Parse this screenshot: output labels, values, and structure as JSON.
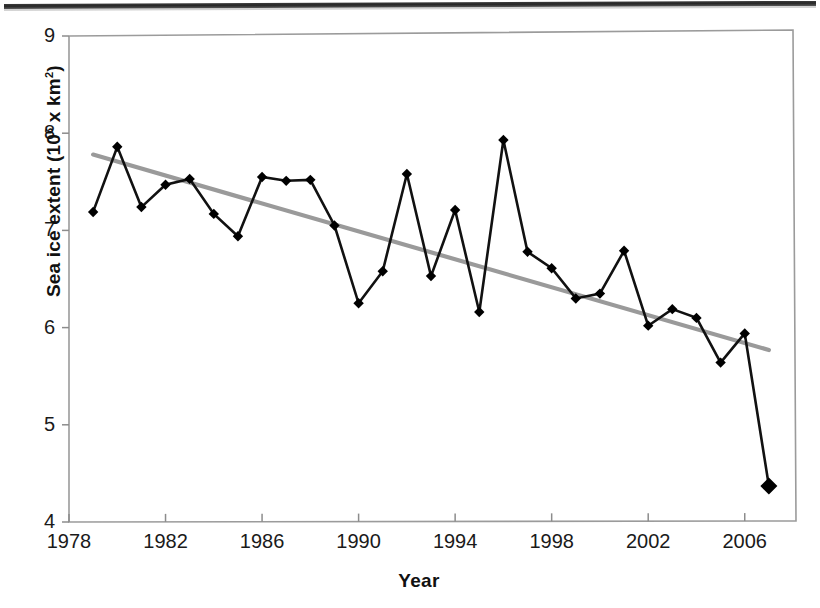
{
  "figure": {
    "y_axis_title_main": "Sea ice extent (10",
    "y_axis_title_exp": "6",
    "y_axis_title_tail": " x km",
    "y_axis_title_tail_exp": "2",
    "y_axis_title_close": ")",
    "y_axis_title_plain": "Sea ice extent (10⁶ x km²)",
    "x_axis_title": "Year",
    "y_ticks": [
      "4",
      "5",
      "6",
      "7",
      "8",
      "9"
    ],
    "x_ticks": [
      "1978",
      "1982",
      "1986",
      "1990",
      "1994",
      "1998",
      "2002",
      "2006"
    ],
    "colors": {
      "data_line": "#111111",
      "marker": "#000000",
      "trend_line": "#9a9a9a",
      "axis": "#8c8c8c",
      "plot_border": "#9b9b9b",
      "text": "#1a1a1a",
      "background": "#ffffff"
    }
  },
  "chart_data": {
    "type": "line",
    "title": "",
    "xlabel": "Year",
    "ylabel": "Sea ice extent (10⁶ x km²)",
    "xlim": [
      1978,
      2008
    ],
    "ylim": [
      4,
      9
    ],
    "xticks": [
      1978,
      1982,
      1986,
      1990,
      1994,
      1998,
      2002,
      2006
    ],
    "yticks": [
      4,
      5,
      6,
      7,
      8,
      9
    ],
    "grid": false,
    "legend": null,
    "x": [
      1979,
      1980,
      1981,
      1982,
      1983,
      1984,
      1985,
      1986,
      1987,
      1988,
      1989,
      1990,
      1991,
      1992,
      1993,
      1994,
      1995,
      1996,
      1997,
      1998,
      1999,
      2000,
      2001,
      2002,
      2003,
      2004,
      2005,
      2006,
      2007
    ],
    "series": [
      {
        "name": "Sea ice extent",
        "style": "line-with-diamond-markers",
        "values": [
          7.19,
          7.86,
          7.24,
          7.47,
          7.53,
          7.17,
          6.94,
          7.55,
          7.51,
          7.52,
          7.05,
          6.25,
          6.58,
          7.58,
          6.53,
          7.21,
          6.16,
          7.93,
          6.78,
          6.61,
          6.3,
          6.35,
          6.79,
          6.02,
          6.19,
          6.1,
          5.64,
          5.94,
          4.37
        ]
      },
      {
        "name": "Linear trend",
        "style": "straight-grey-line",
        "x_endpoints": [
          1979,
          2007
        ],
        "y_endpoints": [
          7.78,
          5.77
        ]
      }
    ],
    "annotations": []
  }
}
